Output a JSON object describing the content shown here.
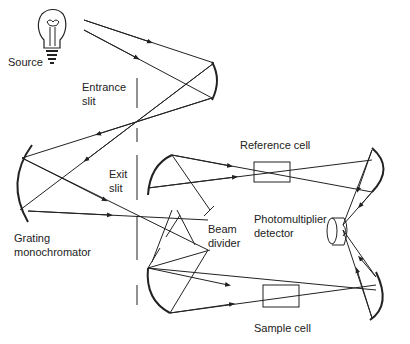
{
  "diagram": {
    "labels": {
      "source": "Source",
      "entrance_slit_1": "Entrance",
      "entrance_slit_2": "slit",
      "exit_slit_1": "Exit",
      "exit_slit_2": "slit",
      "grating_1": "Grating",
      "grating_2": "monochromator",
      "reference_cell": "Reference cell",
      "beam_1": "Beam",
      "beam_2": "divider",
      "pmt_1": "Photomultiplier",
      "pmt_2": "detector",
      "sample_cell": "Sample cell"
    },
    "colors": {
      "line": "#222222",
      "background": "#ffffff"
    }
  }
}
